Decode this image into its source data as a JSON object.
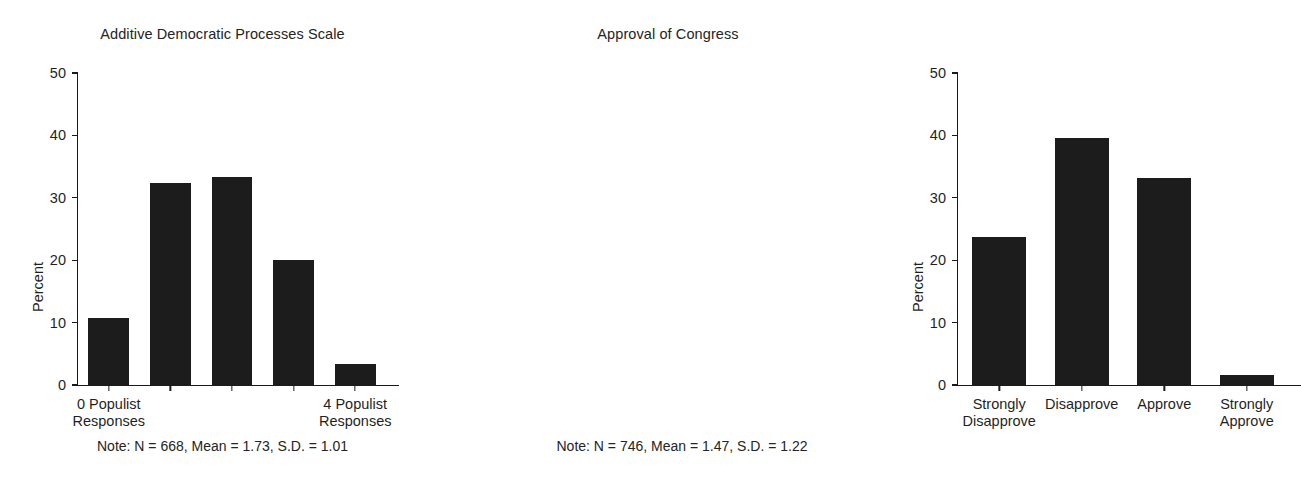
{
  "chart_data": [
    {
      "type": "bar",
      "title": "Additive Democratic Processes Scale",
      "xlabel": "",
      "ylabel": "Percent",
      "ylim": [
        0,
        50
      ],
      "yticks": [
        0,
        10,
        20,
        30,
        40,
        50
      ],
      "ytick_labels": [
        "0",
        "10",
        "20",
        "30",
        "40",
        "50"
      ],
      "grid": false,
      "legend": false,
      "categories": [
        "0 Populist Responses",
        "1",
        "2",
        "3",
        "4 Populist Responses"
      ],
      "tick_labels": [
        "0 Populist\nResponses",
        "",
        "",
        "",
        "4 Populist\nResponses"
      ],
      "tick_labels_lines": [
        [
          "0 Populist",
          "Responses"
        ],
        [],
        [],
        [],
        [
          "4 Populist",
          "Responses"
        ]
      ],
      "values": [
        10.8,
        32.3,
        33.4,
        20.0,
        3.4
      ],
      "bar_color": "#1c1c1c",
      "note": "Note: N = 668, Mean = 1.73, S.D. = 1.01"
    },
    {
      "type": "bar",
      "title": "Approval of Congress",
      "xlabel": "",
      "ylabel": "Percent",
      "ylim": [
        0,
        50
      ],
      "yticks": [
        0,
        10,
        20,
        30,
        40,
        50
      ],
      "ytick_labels": [
        "0",
        "10",
        "20",
        "30",
        "40",
        "50"
      ],
      "grid": false,
      "legend": false,
      "categories": [
        "Strongly Disapprove",
        "Disapprove",
        "Approve",
        "Strongly Approve"
      ],
      "tick_labels_lines": [
        [
          "Strongly",
          "Disapprove"
        ],
        [
          "Disapprove"
        ],
        [
          "Approve"
        ],
        [
          "Strongly",
          "Approve"
        ]
      ],
      "values": [
        23.7,
        39.6,
        33.2,
        1.6
      ],
      "bar_color": "#1c1c1c",
      "note": "Note: N = 746, Mean = 1.47, S.D. = 1.22"
    }
  ]
}
